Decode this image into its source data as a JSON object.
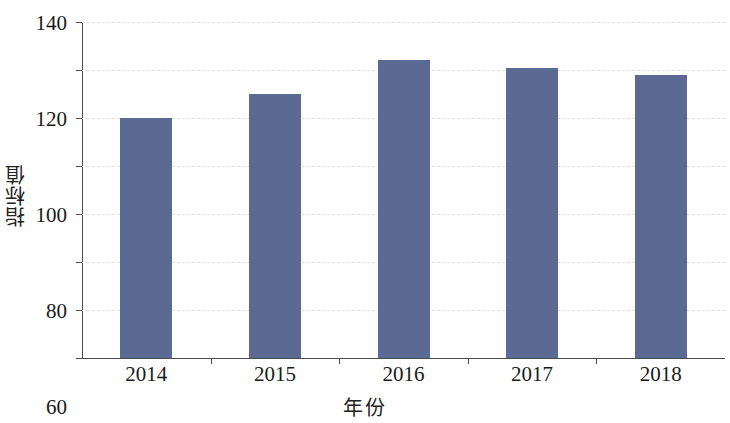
{
  "chart_data": {
    "type": "bar",
    "title": "",
    "xlabel": "年份",
    "ylabel": "指标值",
    "categories": [
      "2014",
      "2015",
      "2016",
      "2017",
      "2018"
    ],
    "values": [
      100,
      110,
      124,
      121,
      118
    ],
    "series": [
      {
        "name": "指标值",
        "values": [
          100,
          110,
          124,
          121,
          118
        ]
      }
    ],
    "ylim": [
      0,
      140
    ],
    "ytick_labels": [
      "0",
      "20",
      "40",
      "60",
      "80",
      "100",
      "120",
      "140"
    ],
    "ytick_values": [
      0,
      20,
      40,
      60,
      80,
      100,
      120,
      140
    ],
    "xtick_labels": [
      "2014",
      "2015",
      "2016",
      "2017",
      "2018"
    ],
    "grid": "horizontal-dashed",
    "legend": "none",
    "bar_color": "#5a6a92",
    "grid_color": "#e2e2e6",
    "axis_color": "#4a4a4a",
    "background_color": "#ffffff"
  }
}
